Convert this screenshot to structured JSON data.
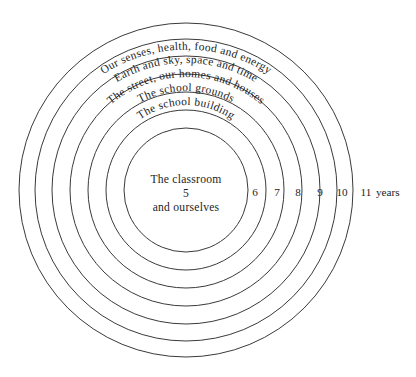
{
  "diagram": {
    "type": "concentric-circles",
    "background_color": "#ffffff",
    "stroke_color": "#3a3a3a",
    "text_color": "#1d1d1d",
    "center": {
      "x": 186,
      "y": 190
    },
    "rings": [
      {
        "index": 1,
        "radius": 62,
        "label": ""
      },
      {
        "index": 2,
        "radius": 80,
        "label": "The school building"
      },
      {
        "index": 3,
        "radius": 98,
        "label": "The school grounds"
      },
      {
        "index": 4,
        "radius": 116,
        "label": "The street, our homes and houses"
      },
      {
        "index": 5,
        "radius": 134,
        "label": "Earth and sky, space  and time"
      },
      {
        "index": 6,
        "radius": 151,
        "label": "Our senses, health, food and energy"
      },
      {
        "index": 7,
        "radius": 167,
        "label": ""
      }
    ],
    "center_label": {
      "line1": "The classroom",
      "line2": "5",
      "line3": "and ourselves"
    },
    "age_axis": {
      "numbers": [
        "6",
        "7",
        "8",
        "9",
        "10",
        "11"
      ],
      "unit": "years",
      "positions_x": [
        255,
        277,
        298,
        320,
        342,
        366
      ],
      "baseline_y": 196
    }
  }
}
